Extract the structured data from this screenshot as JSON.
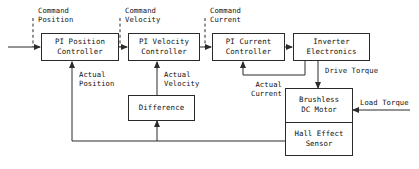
{
  "diagram": {
    "background": "#ffffff",
    "line_color": "#2b2b2b",
    "blocks": [
      {
        "id": "pi-position",
        "line1": "PI Position",
        "line2": "Controller"
      },
      {
        "id": "pi-velocity",
        "line1": "PI Velocity",
        "line2": "Controller"
      },
      {
        "id": "pi-current",
        "line1": "PI Current",
        "line2": "Controller"
      },
      {
        "id": "inverter",
        "line1": "Inverter",
        "line2": "Electronics"
      },
      {
        "id": "difference",
        "line1": "Difference",
        "line2": ""
      },
      {
        "id": "motor",
        "line1": "Brushless",
        "line2": "DC Motor"
      },
      {
        "id": "hall",
        "line1": "Hall Effect",
        "line2": "Sensor"
      }
    ],
    "signals": [
      {
        "id": "command-position",
        "line1": "Command",
        "line2": "Position",
        "style": "dashed"
      },
      {
        "id": "command-velocity",
        "line1": "Command",
        "line2": "Velocity",
        "style": "dashed"
      },
      {
        "id": "command-current",
        "line1": "Command",
        "line2": "Current",
        "style": "dashed"
      },
      {
        "id": "actual-position",
        "line1": "Actual",
        "line2": "Position",
        "style": "solid"
      },
      {
        "id": "actual-velocity",
        "line1": "Actual",
        "line2": "Velocity",
        "style": "solid"
      },
      {
        "id": "actual-current",
        "line1": "Actual",
        "line2": "Current",
        "style": "solid"
      },
      {
        "id": "drive-torque",
        "line1": "Drive Torque",
        "line2": "",
        "style": "solid"
      },
      {
        "id": "load-torque",
        "line1": "Load Torque",
        "line2": "",
        "style": "solid"
      }
    ]
  }
}
